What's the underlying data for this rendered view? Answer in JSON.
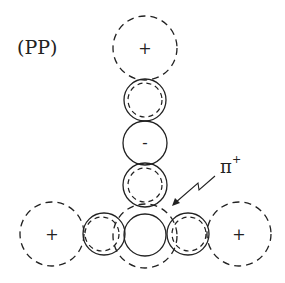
{
  "diagram": {
    "title_label": "(PP)",
    "particle_label": "π",
    "particle_charge": "+",
    "charges": {
      "top": "+",
      "middle": "-",
      "left": "+",
      "right": "+"
    },
    "colors": {
      "stroke": "#222222",
      "background": "#ffffff"
    },
    "elements": [
      {
        "id": "top-large-dashed",
        "cx": 145,
        "cy": 48,
        "r": 32,
        "style": "dashed",
        "charge": "+"
      },
      {
        "id": "upper-small",
        "cx": 145,
        "cy": 100,
        "r": 21,
        "style": "solid+inner-dashed"
      },
      {
        "id": "middle-small-negative",
        "cx": 145,
        "cy": 143,
        "r": 22,
        "style": "solid",
        "charge": "-"
      },
      {
        "id": "lower-small",
        "cx": 145,
        "cy": 185,
        "r": 22,
        "style": "solid+inner-dashed"
      },
      {
        "id": "center-solid",
        "cx": 145,
        "cy": 235,
        "r": 21,
        "style": "solid"
      },
      {
        "id": "center-large-dashed",
        "cx": 145,
        "cy": 236,
        "r": 32,
        "style": "dashed"
      },
      {
        "id": "left-small",
        "cx": 104,
        "cy": 234,
        "r": 21,
        "style": "solid+inner-dashed"
      },
      {
        "id": "right-small",
        "cx": 188,
        "cy": 234,
        "r": 21,
        "style": "solid+inner-dashed"
      },
      {
        "id": "left-large-dashed",
        "cx": 52,
        "cy": 234,
        "r": 32,
        "style": "dashed",
        "charge": "+"
      },
      {
        "id": "right-large-dashed",
        "cx": 239,
        "cy": 234,
        "r": 32,
        "style": "dashed",
        "charge": "+"
      }
    ]
  }
}
